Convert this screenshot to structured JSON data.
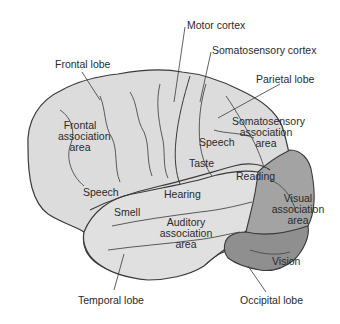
{
  "diagram": {
    "colors": {
      "cortex_fill": "#dcdcdc",
      "occipital_fill": "#8f8f8f",
      "visual_association_fill": "#a3a3a3",
      "outline": "#3a3a3a",
      "label_text": "#2a2a2a"
    },
    "callouts": {
      "frontal_lobe": "Frontal lobe",
      "motor_cortex": "Motor cortex",
      "somatosensory_cortex": "Somatosensory cortex",
      "parietal_lobe": "Parietal lobe",
      "temporal_lobe": "Temporal lobe",
      "occipital_lobe": "Occipital lobe"
    },
    "regions": {
      "frontal_association_l1": "Frontal",
      "frontal_association_l2": "association",
      "frontal_association_l3": "area",
      "speech_frontal": "Speech",
      "speech_parietal": "Speech",
      "somatosensory_assoc_l1": "Somatosensory",
      "somatosensory_assoc_l2": "association",
      "somatosensory_assoc_l3": "area",
      "taste": "Taste",
      "reading": "Reading",
      "hearing": "Hearing",
      "smell": "Smell",
      "auditory_assoc_l1": "Auditory",
      "auditory_assoc_l2": "association",
      "auditory_assoc_l3": "area",
      "visual_assoc_l1": "Visual",
      "visual_assoc_l2": "association",
      "visual_assoc_l3": "area",
      "vision": "Vision"
    }
  }
}
